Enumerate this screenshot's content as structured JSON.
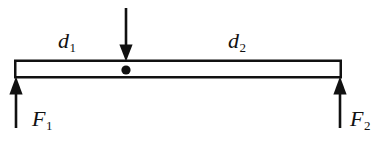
{
  "figure": {
    "type": "free-body-diagram",
    "background_color": "#ffffff",
    "ink_color": "#111111",
    "labels": {
      "distance_left": {
        "base": "d",
        "sub": "1",
        "full": "d1"
      },
      "distance_right": {
        "base": "d",
        "sub": "2",
        "full": "d2"
      },
      "force_left": {
        "base": "F",
        "sub": "1",
        "full": "F1"
      },
      "force_right": {
        "base": "F",
        "sub": "2",
        "full": "F2"
      }
    },
    "elements": {
      "beam": {
        "name": "beam",
        "x1": 15,
        "y1": 61,
        "x2": 341,
        "y2": 77
      },
      "load_arrow": {
        "name": "downward-load-arrow",
        "x": 126,
        "y_start": 8,
        "y_end": 61,
        "direction": "down"
      },
      "fulcrum_dot": {
        "name": "fulcrum-pivot-dot",
        "cx": 126,
        "cy": 70,
        "r": 4.5
      },
      "force_arrow_left": {
        "name": "upward-force-arrow-left",
        "x": 16,
        "y_start": 128,
        "y_end": 78,
        "direction": "up"
      },
      "force_arrow_right": {
        "name": "upward-force-arrow-right",
        "x": 340,
        "y_start": 128,
        "y_end": 78,
        "direction": "up"
      }
    }
  }
}
